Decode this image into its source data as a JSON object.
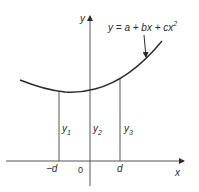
{
  "diagram": {
    "equation": {
      "lhs": "y",
      "rhs_prefix": " = a + bx + cx",
      "exponent": "2"
    },
    "axes": {
      "x_label": "x",
      "y_label": "y",
      "origin_label": "0"
    },
    "ticks": {
      "minus_d": "−d",
      "d": "d"
    },
    "ordinates": [
      {
        "base": "y",
        "sub": "1"
      },
      {
        "base": "y",
        "sub": "2"
      },
      {
        "base": "y",
        "sub": "3"
      }
    ],
    "colors": {
      "line": "#2a2a2a",
      "axis": "#555555",
      "background": "#ffffff"
    }
  }
}
